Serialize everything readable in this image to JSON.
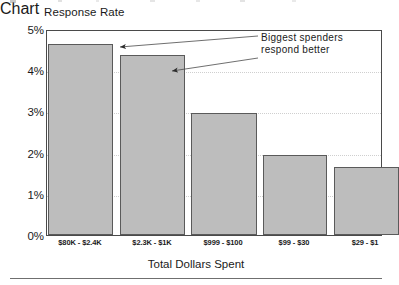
{
  "chart_data": {
    "type": "bar",
    "title": "",
    "ylabel": "Response Rate",
    "xlabel": "Total Dollars Spent",
    "categories": [
      "$80K - $2.4K",
      "$2.3K - $1K",
      "$999 - $100",
      "$99 - $30",
      "$29 - $1"
    ],
    "values": [
      4.68,
      4.42,
      2.99,
      1.95,
      1.66
    ],
    "value_unit": "percent",
    "ylim": [
      0,
      5
    ],
    "ytick_values": [
      0,
      1,
      2,
      3,
      4,
      5
    ],
    "ytick_labels": [
      "0%",
      "1%",
      "2%",
      "3%",
      "4%",
      "5%"
    ],
    "grid": "horizontal-dotted",
    "legend": "none",
    "bar_fill_color": "#bdbdbd",
    "bar_border_color": "#5a5a5a",
    "annotations": [
      {
        "text_line1": "Biggest spenders",
        "text_line2": "respond better",
        "points_to": [
          "$2.3K - $1K bar top",
          "$999 - $100 bar top"
        ]
      }
    ]
  },
  "axes": {
    "y_title": "Response Rate",
    "x_title": "Total Dollars Spent",
    "y_ticks": [
      {
        "label": "5%",
        "value": 5
      },
      {
        "label": "4%",
        "value": 4
      },
      {
        "label": "3%",
        "value": 3
      },
      {
        "label": "2%",
        "value": 2
      },
      {
        "label": "1%",
        "value": 1
      },
      {
        "label": "0%",
        "value": 0
      }
    ],
    "x_ticks": [
      {
        "label": "$80K - $2.4K"
      },
      {
        "label": "$2.3K - $1K"
      },
      {
        "label": "$999 - $100"
      },
      {
        "label": "$99 - $30"
      },
      {
        "label": "$29 - $1"
      }
    ]
  },
  "annotation": {
    "line1": "Biggest spenders",
    "line2": "respond better"
  }
}
